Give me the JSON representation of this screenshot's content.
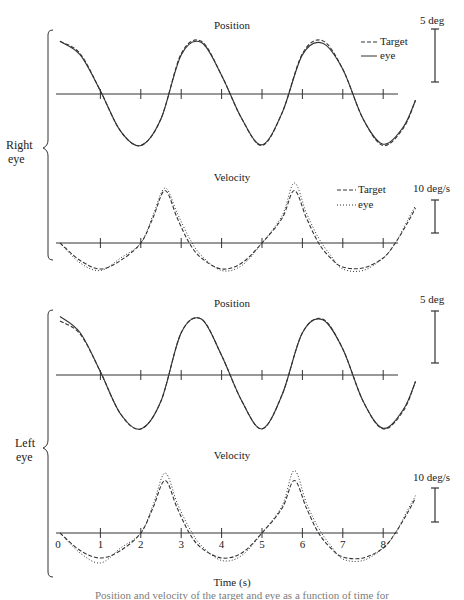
{
  "chart_data": [
    {
      "type": "line",
      "panel": "right-eye-position",
      "title": "Position",
      "group_label": "Right eye",
      "xlabel": "Time (s)",
      "ylabel": "",
      "scale_bar": "5 deg",
      "legend": [
        {
          "name": "Target",
          "style": "dashed"
        },
        {
          "name": "eye",
          "style": "solid"
        }
      ],
      "x_ticks": [
        0,
        1,
        2,
        3,
        4,
        5,
        6,
        7,
        8
      ],
      "xlim": [
        0,
        8.8
      ],
      "series": [
        {
          "name": "Target",
          "x": [
            0,
            0.5,
            1,
            1.5,
            2,
            2.5,
            3,
            3.5,
            4,
            4.5,
            5,
            5.5,
            6,
            6.5,
            7,
            7.5,
            8,
            8.5,
            8.8
          ],
          "values": [
            8.5,
            6.5,
            0.5,
            -6,
            -8.3,
            -4,
            6.5,
            8.5,
            3,
            -4,
            -8.3,
            -3,
            6.5,
            8.6,
            4,
            -4,
            -8.3,
            -5.5,
            -1
          ]
        },
        {
          "name": "eye",
          "x": [
            0,
            0.5,
            1,
            1.5,
            2,
            2.5,
            3,
            3.5,
            4,
            4.5,
            5,
            5.5,
            6,
            6.5,
            7,
            7.5,
            8,
            8.5,
            8.8
          ],
          "values": [
            8.5,
            6.3,
            0.5,
            -6,
            -8.3,
            -4,
            6.3,
            8.3,
            3,
            -4,
            -8.2,
            -3,
            6.3,
            8.2,
            4,
            -4,
            -8.1,
            -5.3,
            -1
          ]
        }
      ]
    },
    {
      "type": "line",
      "panel": "right-eye-velocity",
      "title": "Velocity",
      "group_label": "Right eye",
      "scale_bar": "10 deg/s",
      "legend": [
        {
          "name": "Target",
          "style": "dashed"
        },
        {
          "name": "eye",
          "style": "dotted"
        }
      ],
      "x_ticks": [
        0,
        1,
        2,
        3,
        4,
        5,
        6,
        7,
        8
      ],
      "xlim": [
        0,
        8.8
      ],
      "series": [
        {
          "name": "Target",
          "x": [
            0,
            0.5,
            1,
            1.5,
            2,
            2.3,
            2.6,
            2.9,
            3.2,
            3.5,
            4,
            4.5,
            5,
            5.5,
            5.8,
            6.1,
            6.4,
            6.7,
            7,
            7.5,
            8,
            8.3,
            8.6,
            8.8
          ],
          "values": [
            0,
            -3.5,
            -5.2,
            -3.5,
            0,
            5,
            10.5,
            5,
            0,
            -3,
            -5.2,
            -4,
            0,
            5,
            10.5,
            5,
            0,
            -3,
            -4.8,
            -5,
            -3,
            0,
            4,
            7
          ]
        },
        {
          "name": "eye",
          "x": [
            0,
            0.5,
            1,
            1.5,
            2,
            2.3,
            2.6,
            2.9,
            3.2,
            3.5,
            4,
            4.5,
            5,
            5.5,
            5.8,
            6.1,
            6.4,
            6.7,
            7,
            7.5,
            8,
            8.3,
            8.6,
            8.8
          ],
          "values": [
            0,
            -4,
            -5.5,
            -3,
            0,
            5.5,
            11,
            6,
            1,
            -2.5,
            -5.5,
            -4.5,
            0,
            5.5,
            12,
            6,
            1,
            -2.5,
            -5.2,
            -5.5,
            -3,
            0,
            4.5,
            7.5
          ]
        }
      ]
    },
    {
      "type": "line",
      "panel": "left-eye-position",
      "title": "Position",
      "group_label": "Left eye",
      "scale_bar": "5 deg",
      "x_ticks": [
        0,
        1,
        2,
        3,
        4,
        5,
        6,
        7,
        8
      ],
      "xlim": [
        0,
        8.8
      ],
      "series": [
        {
          "name": "Target",
          "x": [
            0,
            0.5,
            1,
            1.5,
            2,
            2.5,
            3,
            3.5,
            4,
            4.5,
            5,
            5.5,
            6,
            6.5,
            7,
            7.5,
            8,
            8.5,
            8.8
          ],
          "values": [
            8.3,
            6.3,
            0.5,
            -6,
            -8.3,
            -4,
            6.5,
            8.6,
            3,
            -4,
            -8.3,
            -3,
            6.5,
            8.6,
            4,
            -4,
            -8.3,
            -5.5,
            -1
          ]
        },
        {
          "name": "eye",
          "x": [
            0,
            0.5,
            1,
            1.5,
            2,
            2.5,
            3,
            3.5,
            4,
            4.5,
            5,
            5.5,
            6,
            6.5,
            7,
            7.5,
            8,
            8.5,
            8.8
          ],
          "values": [
            9,
            6.5,
            0.5,
            -6,
            -8.3,
            -4,
            6.5,
            8.6,
            3,
            -4,
            -8.3,
            -3,
            6.5,
            8.5,
            4,
            -4,
            -8.2,
            -5.3,
            -1
          ]
        }
      ]
    },
    {
      "type": "line",
      "panel": "left-eye-velocity",
      "title": "Velocity",
      "group_label": "Left eye",
      "scale_bar": "10 deg/s",
      "x_ticks": [
        0,
        1,
        2,
        3,
        4,
        5,
        6,
        7,
        8
      ],
      "xlim": [
        0,
        8.8
      ],
      "series": [
        {
          "name": "Target",
          "x": [
            0,
            0.5,
            1,
            1.5,
            2,
            2.3,
            2.6,
            2.9,
            3.2,
            3.5,
            4,
            4.5,
            5,
            5.5,
            5.8,
            6.1,
            6.4,
            6.7,
            7,
            7.5,
            8,
            8.3,
            8.6,
            8.8
          ],
          "values": [
            0,
            -3.5,
            -5,
            -3.5,
            0,
            5,
            10.5,
            5,
            0,
            -3,
            -5,
            -4,
            0,
            5,
            10.5,
            5,
            0,
            -3,
            -4.8,
            -5,
            -3,
            0,
            4,
            7
          ]
        },
        {
          "name": "eye",
          "x": [
            0,
            0.5,
            1,
            1.5,
            2,
            2.3,
            2.6,
            2.9,
            3.2,
            3.5,
            4,
            4.5,
            5,
            5.5,
            5.8,
            6.1,
            6.4,
            6.7,
            7,
            7.5,
            8,
            8.3,
            8.6,
            8.8
          ],
          "values": [
            0,
            -4,
            -6,
            -3,
            0,
            5.5,
            12,
            6,
            1,
            -2.5,
            -5.5,
            -4.5,
            0,
            5.5,
            12.5,
            6,
            1,
            -2.5,
            -5.2,
            -5.5,
            -3,
            0,
            4.5,
            7.5
          ]
        }
      ]
    }
  ],
  "labels": {
    "right_eye": [
      "Right",
      "eye"
    ],
    "left_eye": [
      "Left",
      "eye"
    ],
    "position_title": "Position",
    "velocity_title": "Velocity",
    "pos_scale": "5 deg",
    "vel_scale": "10 deg/s",
    "legend_target": "Target",
    "legend_eye": "eye",
    "x_axis_label": "Time (s)",
    "x_ticks": [
      "0",
      "1",
      "2",
      "3",
      "4",
      "5",
      "6",
      "7",
      "8"
    ],
    "caption": "Position and velocity of the target and eye as a function of time for"
  }
}
